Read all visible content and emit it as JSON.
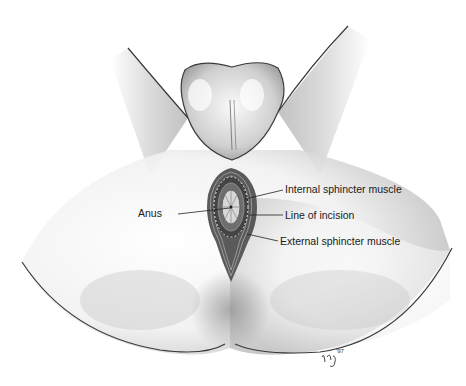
{
  "figure": {
    "type": "anatomical illustration",
    "labels": {
      "internal_sphincter": "Internal sphincter muscle",
      "line_of_incision": "Line of incision",
      "anus": "Anus",
      "external_sphincter": "External sphincter muscle"
    },
    "signature": "ncj '97"
  },
  "colors": {
    "background": "#ffffff",
    "outline": "#3a3a3a",
    "shading": "#9a9a9a",
    "text": "#1a1a1a"
  }
}
